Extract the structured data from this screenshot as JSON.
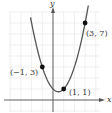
{
  "chart_data": {
    "type": "line",
    "title": "",
    "xlabel": "x",
    "ylabel": "y",
    "equation": "y = x^2 - x + 1",
    "grid": true,
    "xlim": [
      -4,
      4.5
    ],
    "ylim": [
      -1.2,
      8
    ],
    "points": [
      {
        "x": -1,
        "y": 3,
        "label": "(−1, 3)"
      },
      {
        "x": 1,
        "y": 1,
        "label": "(1, 1)"
      },
      {
        "x": 3,
        "y": 7,
        "label": "(3, 7)"
      }
    ],
    "curve_x_range": [
      -2.1,
      3.3
    ]
  },
  "layout": {
    "origin_px": [
      53,
      100
    ],
    "unit_px_x": 10.7,
    "unit_px_y": 11,
    "colors": {
      "grid": "#e4e4e4",
      "axis": "#555555",
      "curve": "#555555",
      "point": "#111111"
    }
  }
}
